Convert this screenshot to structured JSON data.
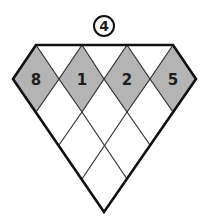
{
  "puzzle": {
    "target": "4",
    "top_row": [
      "8",
      "1",
      "2",
      "5"
    ],
    "colors": {
      "fill_shaded": "#b4b4b4",
      "fill_empty": "#ffffff",
      "outline": "#111111",
      "inner_line": "#333333",
      "text": "#1e1e1e"
    }
  }
}
